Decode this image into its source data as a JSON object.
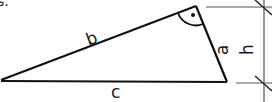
{
  "diagram": {
    "type": "right-triangle",
    "caption_fragment": "s.",
    "sides": {
      "a": "a",
      "b": "b",
      "c": "c"
    },
    "height_label": "h",
    "right_angle_marker": "dot-in-arc",
    "colors": {
      "stroke": "#111111",
      "dim_line": "#555555",
      "background": "#ffffff"
    }
  }
}
